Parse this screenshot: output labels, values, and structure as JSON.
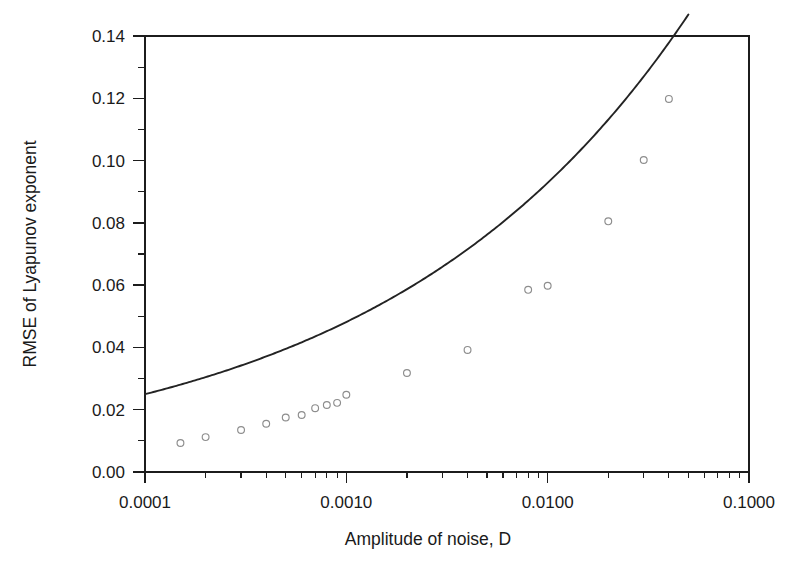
{
  "chart_data": {
    "type": "scatter",
    "title": "",
    "xlabel": "Amplitude of noise, D",
    "ylabel": "RMSE of Lyapunov exponent",
    "xscale": "log",
    "yscale": "linear",
    "xlim": [
      0.0001,
      0.1
    ],
    "ylim": [
      0.0,
      0.14
    ],
    "grid": false,
    "legend": null,
    "x_tick_labels": [
      "0.0001",
      "0.0010",
      "0.0100",
      "0.1000"
    ],
    "x_tick_values": [
      0.0001,
      0.001,
      0.01,
      0.1
    ],
    "y_tick_labels": [
      "0.00",
      "0.02",
      "0.04",
      "0.06",
      "0.08",
      "0.10",
      "0.12",
      "0.14"
    ],
    "y_tick_values": [
      0.0,
      0.02,
      0.04,
      0.06,
      0.08,
      0.1,
      0.12,
      0.14
    ],
    "y_minor_ticks": [
      0.01,
      0.03,
      0.05,
      0.07,
      0.09,
      0.11,
      0.13
    ],
    "series": [
      {
        "name": "RMSE measurements",
        "marker": "open-circle",
        "marker_color": "#8d8d8d",
        "points": [
          {
            "x": 0.00015,
            "y": 0.0093
          },
          {
            "x": 0.0002,
            "y": 0.0112
          },
          {
            "x": 0.0003,
            "y": 0.0135
          },
          {
            "x": 0.0004,
            "y": 0.0155
          },
          {
            "x": 0.0005,
            "y": 0.0175
          },
          {
            "x": 0.0006,
            "y": 0.0183
          },
          {
            "x": 0.0007,
            "y": 0.0205
          },
          {
            "x": 0.0008,
            "y": 0.0215
          },
          {
            "x": 0.0009,
            "y": 0.0222
          },
          {
            "x": 0.001,
            "y": 0.0248
          },
          {
            "x": 0.002,
            "y": 0.0318
          },
          {
            "x": 0.004,
            "y": 0.0392
          },
          {
            "x": 0.008,
            "y": 0.0585
          },
          {
            "x": 0.01,
            "y": 0.0598
          },
          {
            "x": 0.02,
            "y": 0.0805
          },
          {
            "x": 0.03,
            "y": 0.1002
          },
          {
            "x": 0.04,
            "y": 0.1198
          }
        ]
      },
      {
        "name": "Fitted power-law curve",
        "marker": "none",
        "line_color": "#232323",
        "fit": {
          "form": "y = a * x^b",
          "a": 0.345,
          "b": 0.285,
          "x_start": 0.0001,
          "x_end": 0.05
        }
      }
    ]
  },
  "axes": {
    "x_axis_title": "Amplitude of noise, D",
    "y_axis_title": "RMSE of Lyapunov exponent"
  },
  "colors": {
    "axis": "#1c1c1c",
    "curve": "#232323",
    "marker": "#8d8d8d",
    "background": "#ffffff",
    "text": "#1a1a1a"
  }
}
